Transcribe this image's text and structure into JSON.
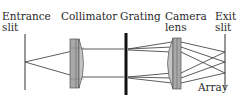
{
  "labels": {
    "entrance_slit_line1": "Entrance",
    "entrance_slit_line2": "slit",
    "collimator": "Collimator",
    "grating": "Grating",
    "camera_lens_line1": "Camera",
    "camera_lens_line2": "lens",
    "exit_slit_line1": "Exit",
    "exit_slit_line2": "slit",
    "array": "Array"
  },
  "colors": {
    "line": "#333333",
    "lens_fill": "#b8b8b8",
    "lens_stroke": "#555555",
    "grating": "#111111"
  }
}
